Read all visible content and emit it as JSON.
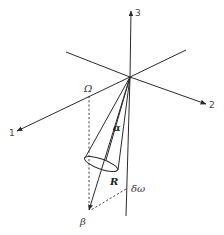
{
  "diagram": {
    "axes": [
      {
        "label": "1",
        "role": "axis-1"
      },
      {
        "label": "2",
        "role": "axis-2"
      },
      {
        "label": "3",
        "role": "axis-3"
      }
    ],
    "labels": {
      "omega_cap": "Ω",
      "alpha": "α",
      "R": "R",
      "delta_omega": "δω",
      "beta": "β"
    },
    "colors": {
      "line": "#2a2a2a",
      "background": "#ffffff"
    }
  }
}
